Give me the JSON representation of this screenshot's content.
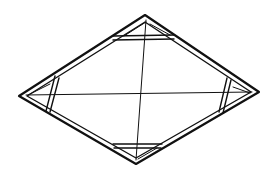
{
  "figure": {
    "stroke_color": "#111111",
    "background": "#ffffff",
    "frame": {
      "top": [
        145,
        16
      ],
      "right": [
        258,
        92
      ],
      "bottom": [
        136,
        163
      ],
      "left": [
        20,
        96
      ]
    },
    "braces": [
      {
        "name": "top",
        "from": [
          113,
          38
        ],
        "to": [
          173,
          37
        ]
      },
      {
        "name": "bottom",
        "from": [
          113,
          146
        ],
        "to": [
          162,
          146
        ]
      },
      {
        "name": "left",
        "from": [
          57,
          76
        ],
        "to": [
          48,
          111
        ]
      },
      {
        "name": "right",
        "from": [
          229,
          78
        ],
        "to": [
          221,
          113
        ]
      }
    ],
    "diagonals": [
      {
        "name": "vertical",
        "from": [
          146,
          20
        ],
        "to": [
          136,
          160
        ]
      },
      {
        "name": "horizontal",
        "from": [
          24,
          95
        ],
        "to": [
          254,
          92
        ]
      }
    ]
  }
}
